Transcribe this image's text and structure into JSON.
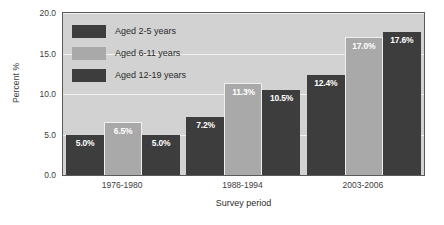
{
  "chart_data": {
    "type": "bar",
    "title": "",
    "xlabel": "Survey period",
    "ylabel": "Percent %",
    "categories": [
      "1976-1980",
      "1988-1994",
      "2003-2006"
    ],
    "series": [
      {
        "name": "Aged 2-5 years",
        "color": "#3d3d3d",
        "values": [
          5.0,
          7.2,
          12.4
        ],
        "labels": [
          "5.0%",
          "7.2%",
          "12.4%"
        ]
      },
      {
        "name": "Aged 6-11 years",
        "color": "#a9a9a9",
        "values": [
          6.5,
          11.3,
          17.0
        ],
        "labels": [
          "6.5%",
          "11.3%",
          "17.0%"
        ]
      },
      {
        "name": "Aged 12-19 years",
        "color": "#3d3d3d",
        "values": [
          5.0,
          10.5,
          17.6
        ],
        "labels": [
          "5.0%",
          "10.5%",
          "17.6%"
        ]
      }
    ],
    "ylim": [
      0.0,
      20.0
    ],
    "yticks": [
      0.0,
      5.0,
      10.0,
      15.0,
      20.0
    ],
    "ytick_labels": [
      "0.0",
      "5.0",
      "10.0",
      "15.0",
      "20.0"
    ],
    "grid": true,
    "legend_position": "upper-left-inside",
    "plot_background": "#d2d2d2",
    "gridline_color": "#f1f1f1",
    "value_label_color": "#ffffff"
  }
}
